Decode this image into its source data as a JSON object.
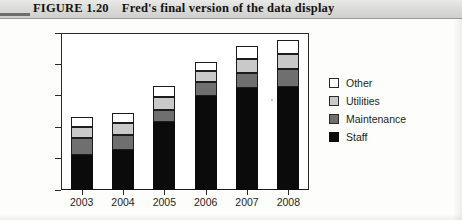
{
  "figure": {
    "label": "FIGURE 1.20",
    "caption": "Fred's final version of the data display"
  },
  "chart_data": {
    "type": "bar",
    "subtype": "stacked-column",
    "title": "Fred's final version of the data display",
    "xlabel": "",
    "ylabel": "",
    "categories": [
      "2003",
      "2004",
      "2005",
      "2006",
      "2007",
      "2008"
    ],
    "ytick_labels": [
      "0",
      "50,000",
      "100,000",
      "150,000",
      "200,000",
      "250,000"
    ],
    "ytick_values": [
      0,
      50000,
      100000,
      150000,
      200000,
      250000
    ],
    "ylim": [
      0,
      250000
    ],
    "grid": false,
    "legend_position": "right",
    "series": [
      {
        "name": "Staff",
        "color": "#0b0b0b",
        "values": [
          56000,
          64000,
          108000,
          150000,
          162000,
          164000
        ]
      },
      {
        "name": "Maintenance",
        "color": "#6f6f6f",
        "values": [
          27000,
          24000,
          19000,
          22000,
          25000,
          28000
        ]
      },
      {
        "name": "Utilities",
        "color": "#c9c9c9",
        "values": [
          17000,
          19000,
          21000,
          18000,
          22000,
          25000
        ]
      },
      {
        "name": "Other",
        "color": "#ffffff",
        "values": [
          16000,
          16000,
          18000,
          14000,
          20000,
          22000
        ]
      }
    ],
    "totals": [
      116000,
      123000,
      166000,
      204000,
      229000,
      239000
    ]
  },
  "legend": {
    "entries": [
      {
        "label": "Other",
        "swatch": "other"
      },
      {
        "label": "Utilities",
        "swatch": "utilities"
      },
      {
        "label": "Maintenance",
        "swatch": "maintenance"
      },
      {
        "label": "Staff",
        "swatch": "staff"
      }
    ]
  },
  "colors": {
    "other": "#ffffff",
    "utilities": "#c9c9c9",
    "maintenance": "#6f6f6f",
    "staff": "#0b0b0b",
    "axis": "#2a2a2a",
    "title_bar": "#dcdcda"
  }
}
